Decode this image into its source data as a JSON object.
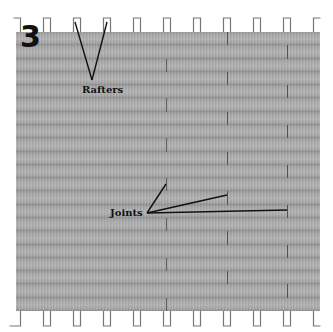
{
  "figure": {
    "number": "3",
    "type": "roof sheathing diagram",
    "labels": {
      "rafters": "Rafters",
      "joints": "Joints"
    }
  },
  "layout": {
    "board_area": {
      "x": 16,
      "y": 32,
      "width": 304,
      "height": 279
    },
    "row_count": 21,
    "rafter_x": [
      17,
      47,
      77,
      107,
      137,
      167,
      197,
      227,
      257,
      287,
      317
    ],
    "joint_cycle_x": [
      227,
      287,
      166
    ],
    "colors": {
      "board": "#a8a8a8",
      "joint": "#555555",
      "rafter_outline": "#777777",
      "leader_line": "#111111"
    }
  }
}
